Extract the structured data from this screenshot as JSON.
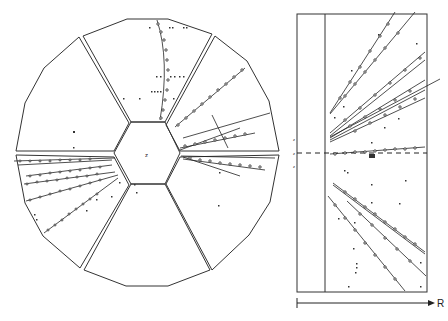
{
  "figure": {
    "type": "particle detector event display",
    "left_panel": {
      "description": "End view (x-y) of drift chamber with hexagonal central region and six sectors",
      "center_label": "z",
      "sectors": 6
    },
    "right_panel": {
      "description": "Side view (R-z projection) of reconstructed tracks",
      "axis_label": "R",
      "z_marks": [
        "z",
        "z",
        "z"
      ]
    }
  },
  "colors": {
    "ink": "#222222",
    "background": "#ffffff"
  }
}
